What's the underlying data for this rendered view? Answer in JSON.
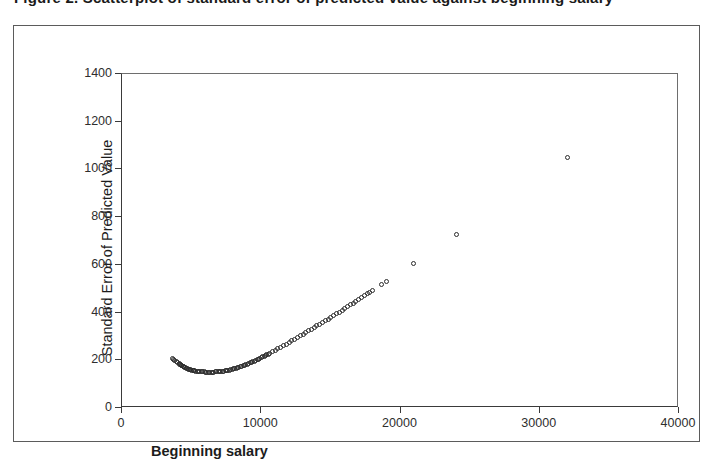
{
  "figure": {
    "title": "Figure 2. Scatterplot of standard error of predicted value against beginning salary",
    "frame_color": "#5b5b5b",
    "marker_color": "#2b2b2b",
    "background": "#ffffff"
  },
  "chart_data": {
    "type": "scatter",
    "title": "",
    "xlabel": "Beginning salary",
    "ylabel": "Standard Error of Predicted Value",
    "xlim": [
      0,
      40000
    ],
    "ylim": [
      0,
      1400
    ],
    "xticks": [
      0,
      10000,
      20000,
      30000,
      40000
    ],
    "yticks": [
      0,
      200,
      400,
      600,
      800,
      1000,
      1200,
      1400
    ],
    "grid": false,
    "legend": "none",
    "marker": "open-circle",
    "series": [
      {
        "name": "Standard Error of Predicted Value",
        "points": [
          [
            3600,
            208
          ],
          [
            3700,
            203
          ],
          [
            3800,
            198
          ],
          [
            3900,
            194
          ],
          [
            4000,
            190
          ],
          [
            4100,
            186
          ],
          [
            4150,
            183
          ],
          [
            4200,
            181
          ],
          [
            4250,
            179
          ],
          [
            4300,
            177
          ],
          [
            4400,
            174
          ],
          [
            4450,
            172
          ],
          [
            4500,
            170
          ],
          [
            4550,
            169
          ],
          [
            4600,
            167
          ],
          [
            4700,
            165
          ],
          [
            4800,
            163
          ],
          [
            4850,
            162
          ],
          [
            4900,
            161
          ],
          [
            5000,
            159
          ],
          [
            5100,
            158
          ],
          [
            5150,
            157
          ],
          [
            5200,
            156
          ],
          [
            5300,
            155
          ],
          [
            5400,
            154
          ],
          [
            5500,
            153
          ],
          [
            5600,
            152
          ],
          [
            5700,
            152
          ],
          [
            5800,
            151
          ],
          [
            5900,
            151
          ],
          [
            6000,
            150
          ],
          [
            6100,
            150
          ],
          [
            6200,
            150
          ],
          [
            6300,
            150
          ],
          [
            6400,
            150
          ],
          [
            6500,
            150
          ],
          [
            6600,
            150
          ],
          [
            6700,
            151
          ],
          [
            6800,
            151
          ],
          [
            6900,
            152
          ],
          [
            7000,
            152
          ],
          [
            7100,
            153
          ],
          [
            7200,
            154
          ],
          [
            7300,
            155
          ],
          [
            7400,
            156
          ],
          [
            7500,
            157
          ],
          [
            7600,
            158
          ],
          [
            7700,
            159
          ],
          [
            7800,
            161
          ],
          [
            7900,
            162
          ],
          [
            8000,
            164
          ],
          [
            8100,
            166
          ],
          [
            8200,
            167
          ],
          [
            8300,
            169
          ],
          [
            8400,
            171
          ],
          [
            8500,
            173
          ],
          [
            8600,
            175
          ],
          [
            8700,
            177
          ],
          [
            8800,
            180
          ],
          [
            8900,
            182
          ],
          [
            9000,
            184
          ],
          [
            9100,
            187
          ],
          [
            9200,
            189
          ],
          [
            9300,
            192
          ],
          [
            9400,
            194
          ],
          [
            9500,
            197
          ],
          [
            9600,
            200
          ],
          [
            9700,
            203
          ],
          [
            9800,
            205
          ],
          [
            9900,
            208
          ],
          [
            10000,
            211
          ],
          [
            10100,
            214
          ],
          [
            10200,
            217
          ],
          [
            10300,
            220
          ],
          [
            10400,
            223
          ],
          [
            10500,
            226
          ],
          [
            10600,
            229
          ],
          [
            10800,
            236
          ],
          [
            11000,
            242
          ],
          [
            11200,
            248
          ],
          [
            11400,
            255
          ],
          [
            11600,
            261
          ],
          [
            11800,
            268
          ],
          [
            12000,
            275
          ],
          [
            12200,
            281
          ],
          [
            12400,
            288
          ],
          [
            12600,
            295
          ],
          [
            12800,
            302
          ],
          [
            13000,
            309
          ],
          [
            13200,
            316
          ],
          [
            13400,
            323
          ],
          [
            13600,
            330
          ],
          [
            13800,
            337
          ],
          [
            14000,
            344
          ],
          [
            14200,
            351
          ],
          [
            14400,
            358
          ],
          [
            14600,
            366
          ],
          [
            14800,
            373
          ],
          [
            15000,
            380
          ],
          [
            15200,
            387
          ],
          [
            15400,
            395
          ],
          [
            15600,
            402
          ],
          [
            15800,
            410
          ],
          [
            16000,
            417
          ],
          [
            16200,
            425
          ],
          [
            16400,
            432
          ],
          [
            16600,
            440
          ],
          [
            16800,
            447
          ],
          [
            17000,
            455
          ],
          [
            17200,
            462
          ],
          [
            17400,
            470
          ],
          [
            17600,
            478
          ],
          [
            17800,
            485
          ],
          [
            18000,
            493
          ],
          [
            18600,
            516
          ],
          [
            19000,
            531
          ],
          [
            20900,
            605
          ],
          [
            24000,
            728
          ],
          [
            32000,
            1050
          ]
        ]
      }
    ],
    "annotations": []
  },
  "axes": {
    "y_title": "Standard Error of Predicted Value",
    "x_title": "Beginning salary",
    "y_tick_labels": [
      "1400",
      "1200",
      "1000",
      "800",
      "600",
      "400",
      "200",
      "0"
    ],
    "x_tick_labels": [
      "0",
      "10000",
      "20000",
      "30000",
      "40000"
    ]
  }
}
